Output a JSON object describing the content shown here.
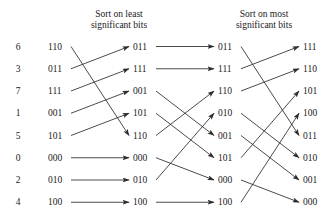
{
  "figure": {
    "captions": [
      {
        "id": "caption-least",
        "line1": "Sort on least",
        "line2": "significant bits"
      },
      {
        "id": "caption-most",
        "line1": "Sort on most",
        "line2": "significant bits"
      }
    ],
    "indices": [
      "6",
      "3",
      "7",
      "1",
      "5",
      "0",
      "2",
      "4"
    ],
    "columns": [
      {
        "id": "column-input",
        "values": [
          "110",
          "011",
          "111",
          "001",
          "101",
          "000",
          "010",
          "100"
        ]
      },
      {
        "id": "column-stage-1",
        "values": [
          "011",
          "111",
          "001",
          "101",
          "110",
          "000",
          "010",
          "100"
        ]
      },
      {
        "id": "column-stage-2",
        "values": [
          "011",
          "111",
          "110",
          "010",
          "001",
          "101",
          "000",
          "100"
        ]
      },
      {
        "id": "column-stage-3",
        "values": [
          "111",
          "110",
          "101",
          "100",
          "011",
          "010",
          "001",
          "000"
        ]
      }
    ],
    "edges": [
      {
        "stage": 1,
        "from": 1,
        "to": 5
      },
      {
        "stage": 1,
        "from": 2,
        "to": 1
      },
      {
        "stage": 1,
        "from": 3,
        "to": 2
      },
      {
        "stage": 1,
        "from": 4,
        "to": 3
      },
      {
        "stage": 1,
        "from": 5,
        "to": 4
      },
      {
        "stage": 1,
        "from": 6,
        "to": 6
      },
      {
        "stage": 1,
        "from": 7,
        "to": 7
      },
      {
        "stage": 1,
        "from": 8,
        "to": 8
      },
      {
        "stage": 2,
        "from": 1,
        "to": 1
      },
      {
        "stage": 2,
        "from": 2,
        "to": 2
      },
      {
        "stage": 2,
        "from": 3,
        "to": 5
      },
      {
        "stage": 2,
        "from": 4,
        "to": 6
      },
      {
        "stage": 2,
        "from": 5,
        "to": 3
      },
      {
        "stage": 2,
        "from": 6,
        "to": 7
      },
      {
        "stage": 2,
        "from": 7,
        "to": 4
      },
      {
        "stage": 2,
        "from": 8,
        "to": 8
      },
      {
        "stage": 3,
        "from": 1,
        "to": 5
      },
      {
        "stage": 3,
        "from": 2,
        "to": 1
      },
      {
        "stage": 3,
        "from": 3,
        "to": 2
      },
      {
        "stage": 3,
        "from": 4,
        "to": 6
      },
      {
        "stage": 3,
        "from": 5,
        "to": 7
      },
      {
        "stage": 3,
        "from": 6,
        "to": 3
      },
      {
        "stage": 3,
        "from": 7,
        "to": 8
      },
      {
        "stage": 3,
        "from": 8,
        "to": 4
      }
    ],
    "colors": {
      "background": "#ffffff",
      "text": "#1a1a1a",
      "edge": "#2b2b2b"
    }
  }
}
